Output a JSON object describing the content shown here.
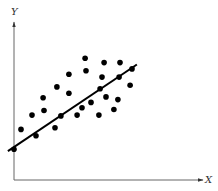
{
  "chart_data": {
    "type": "scatter",
    "title": "",
    "xlabel": "X",
    "ylabel": "Y",
    "grid": false,
    "legend": null,
    "xlim": [
      0,
      100
    ],
    "ylim": [
      0,
      100
    ],
    "points_px_note": "points given in normalized axis units (origin bottom-left)",
    "series": [
      {
        "name": "observations",
        "marker": "filled-circle",
        "color": "#000000",
        "points": [
          {
            "x": 0.0,
            "y": 19.4
          },
          {
            "x": 3.7,
            "y": 32.0
          },
          {
            "x": 11.6,
            "y": 28.0
          },
          {
            "x": 9.5,
            "y": 41.1
          },
          {
            "x": 15.3,
            "y": 52.0
          },
          {
            "x": 15.8,
            "y": 44.0
          },
          {
            "x": 21.6,
            "y": 33.1
          },
          {
            "x": 24.7,
            "y": 40.6
          },
          {
            "x": 22.6,
            "y": 58.9
          },
          {
            "x": 28.9,
            "y": 66.9
          },
          {
            "x": 28.9,
            "y": 54.9
          },
          {
            "x": 33.2,
            "y": 41.1
          },
          {
            "x": 35.8,
            "y": 45.7
          },
          {
            "x": 37.9,
            "y": 69.1
          },
          {
            "x": 37.4,
            "y": 77.1
          },
          {
            "x": 40.5,
            "y": 49.1
          },
          {
            "x": 44.7,
            "y": 41.1
          },
          {
            "x": 45.3,
            "y": 57.7
          },
          {
            "x": 46.3,
            "y": 65.1
          },
          {
            "x": 47.4,
            "y": 74.3
          },
          {
            "x": 48.4,
            "y": 52.6
          },
          {
            "x": 52.6,
            "y": 44.6
          },
          {
            "x": 54.7,
            "y": 50.9
          },
          {
            "x": 55.3,
            "y": 65.1
          },
          {
            "x": 55.8,
            "y": 74.3
          },
          {
            "x": 61.1,
            "y": 60.0
          },
          {
            "x": 62.1,
            "y": 70.3
          }
        ]
      },
      {
        "name": "fit-line",
        "type": "line",
        "color": "#000000",
        "points": [
          {
            "x": -3.2,
            "y": 18.3
          },
          {
            "x": 64.7,
            "y": 73.1
          }
        ]
      }
    ]
  },
  "labels": {
    "x_axis": "X",
    "y_axis": "Y"
  },
  "colors": {
    "axis": "#555555",
    "points": "#000000",
    "line": "#000000"
  }
}
